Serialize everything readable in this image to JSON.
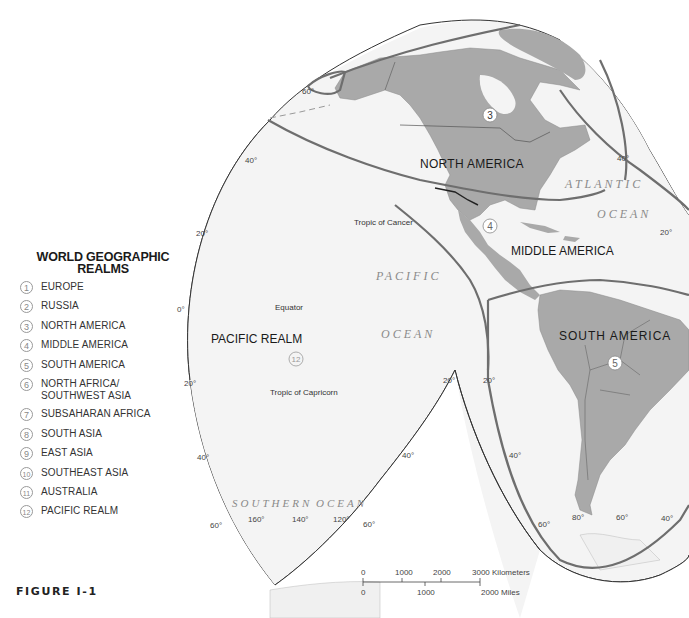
{
  "figure": {
    "label": "FIGURE I-1"
  },
  "legend": {
    "title": "WORLD GEOGRAPHIC\nREALMS",
    "title_line1": "WORLD GEOGRAPHIC",
    "title_line2": "REALMS",
    "items": [
      {
        "num": "1",
        "label": "EUROPE"
      },
      {
        "num": "2",
        "label": "RUSSIA"
      },
      {
        "num": "3",
        "label": "NORTH AMERICA"
      },
      {
        "num": "4",
        "label": "MIDDLE AMERICA"
      },
      {
        "num": "5",
        "label": "SOUTH AMERICA"
      },
      {
        "num": "6",
        "label": "NORTH AFRICA/\nSOUTHWEST ASIA"
      },
      {
        "num": "7",
        "label": "SUBSAHARAN AFRICA"
      },
      {
        "num": "8",
        "label": "SOUTH ASIA"
      },
      {
        "num": "9",
        "label": "EAST ASIA"
      },
      {
        "num": "10",
        "label": "SOUTHEAST ASIA"
      },
      {
        "num": "11",
        "label": "AUSTRALIA"
      },
      {
        "num": "12",
        "label": "PACIFIC REALM"
      }
    ]
  },
  "map": {
    "realm_labels": {
      "north_america": "NORTH AMERICA",
      "middle_america": "MIDDLE AMERICA",
      "south_america": "SOUTH AMERICA",
      "pacific_realm": "PACIFIC REALM"
    },
    "realm_markers": {
      "north_america": "3",
      "middle_america": "4",
      "south_america": "5",
      "pacific_realm": "12"
    },
    "oceans": {
      "pacific_1": "PACIFIC",
      "pacific_2": "OCEAN",
      "atlantic_1": "ATLANTIC",
      "atlantic_2": "OCEAN",
      "southern_1": "SOUTHERN",
      "southern_2": "OCEAN"
    },
    "lines": {
      "tropic_cancer": "Tropic of Cancer",
      "equator": "Equator",
      "tropic_capricorn": "Tropic of Capricorn"
    },
    "latitude_labels": {
      "n60": "60°",
      "n40_left": "40°",
      "n20_left": "20°",
      "zero": "0°",
      "s20_left": "20°",
      "s40_left": "40°",
      "s60_left": "60°",
      "n40_right": "40°",
      "n20_right": "20°",
      "s20_mid_left": "20°",
      "s20_mid_right": "20°",
      "s40_mid_left": "40°",
      "s40_mid_right": "40°",
      "s60_mid_left": "60°",
      "s60_mid_right": "60°",
      "s40_far_right": "40°"
    },
    "longitude_labels": {
      "w160": "160°",
      "w140": "140°",
      "w120": "120°",
      "w80": "80°",
      "w60": "60°"
    },
    "scale": {
      "km_ticks": [
        "0",
        "1000",
        "2000",
        "3000 Kilometers"
      ],
      "mi_ticks": [
        "0",
        "1000",
        "2000 Miles"
      ]
    },
    "colors": {
      "ocean": "#f4f4f4",
      "land": "#a9a9a9",
      "realm_boundary": "#6e6e6e",
      "outline": "#333333"
    }
  }
}
